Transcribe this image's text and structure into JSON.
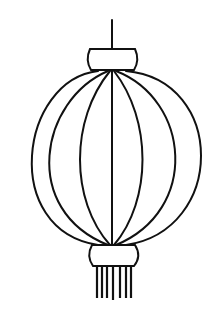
{
  "image": {
    "subject": "Chinese lantern line drawing",
    "stroke_color": "#111111",
    "background_color": "#ffffff"
  },
  "lantern": {
    "hook": {
      "x": 112,
      "y1": 20,
      "y2": 49
    },
    "top_cap": {
      "x": 86,
      "y": 49,
      "width": 53,
      "height": 22
    },
    "bottom_cap": {
      "x": 88,
      "y": 245,
      "width": 51,
      "height": 21
    },
    "top_point": {
      "x": 112,
      "y": 71
    },
    "bottom_point": {
      "x": 112,
      "y": 245
    },
    "ribs_half_widths": [
      96,
      74,
      34,
      0
    ],
    "tassel_x": [
      97,
      102,
      107,
      113,
      120,
      126,
      131
    ],
    "tassel_y": [
      266,
      298
    ]
  }
}
